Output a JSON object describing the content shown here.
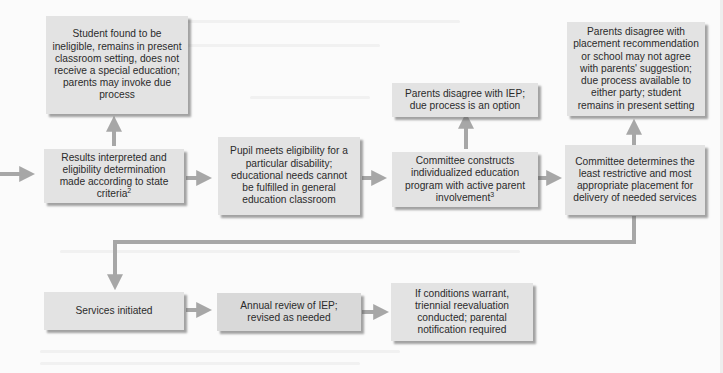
{
  "diagram": {
    "type": "flowchart",
    "title": "",
    "colors": {
      "box_fill": "#d9d9d9",
      "box_fill_light": "#e3e3e3",
      "text": "#2b2b2b",
      "arrow": "#a7a7a7",
      "background": "#fbfbfb"
    },
    "nodes": {
      "ineligible": {
        "text": "Student found to be ineligible, remains in present classroom setting, does not receive a special education; parents may invoke due process"
      },
      "results": {
        "text": "Results interpreted and eligibility determination made according to state criteria",
        "footnote": "2"
      },
      "pupil_meets": {
        "text": "Pupil meets eligibility for a particular disability; educational needs cannot be fulfilled in general education classroom"
      },
      "iep_disagree": {
        "text": "Parents disagree with IEP; due process is an option"
      },
      "committee_constructs": {
        "text": "Committee constructs individualized education program with active parent involvement",
        "footnote": "3"
      },
      "placement_disagree": {
        "text": "Parents disagree with placement recommendation or school may not agree with parents' suggestion; due process available to either party; student remains in present setting"
      },
      "committee_determines": {
        "text": "Committee determines the least restrictive and most appropriate placement for delivery of needed services"
      },
      "services_initiated": {
        "text": "Services initiated"
      },
      "annual_review": {
        "text": "Annual review of IEP; revised as needed"
      },
      "triennial": {
        "text": "If conditions warrant, triennial reevaluation conducted; parental notification required"
      }
    },
    "edges": [
      {
        "from": "(offscreen-left)",
        "to": "results"
      },
      {
        "from": "results",
        "to": "ineligible"
      },
      {
        "from": "results",
        "to": "pupil_meets"
      },
      {
        "from": "pupil_meets",
        "to": "committee_constructs"
      },
      {
        "from": "committee_constructs",
        "to": "iep_disagree"
      },
      {
        "from": "committee_constructs",
        "to": "committee_determines"
      },
      {
        "from": "committee_determines",
        "to": "placement_disagree"
      },
      {
        "from": "committee_determines",
        "to": "services_initiated"
      },
      {
        "from": "services_initiated",
        "to": "annual_review"
      },
      {
        "from": "annual_review",
        "to": "triennial"
      }
    ]
  }
}
